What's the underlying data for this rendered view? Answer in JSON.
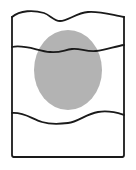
{
  "figure": {
    "title": "Schematic cross-section with wavy boundaries and central ellipse",
    "type": "line-art-diagram",
    "background_color": "#ffffff",
    "canvas": {
      "width": 136,
      "height": 170
    },
    "stroke": {
      "color": "#1a1a1a",
      "width": 1.8,
      "linejoin": "round",
      "linecap": "round"
    },
    "elements": {
      "outer_frame": {
        "name": "outer-frame",
        "description": "Rectangular frame, left/right/bottom straight, top edge wavy",
        "left_x": 12,
        "right_x": 124,
        "top_y": 17,
        "bottom_y": 157,
        "fill": "none"
      },
      "ellipse": {
        "name": "central-ellipse",
        "description": "Gray filled ellipse centered in the frame",
        "center_x": 68,
        "center_y": 70,
        "radius_x": 34,
        "radius_y": 40,
        "fill_color": "#b3b3b3",
        "stroke": "none"
      },
      "wavy_top_edge": {
        "name": "wavy-top-edge",
        "description": "Undulating top boundary of the frame",
        "path": "M 12 17 C 20 10, 34 10, 44 13 C 50 15, 54 21, 60 21 C 68 21, 76 13, 88 12 C 100 11, 112 15, 124 17"
      },
      "wavy_line_upper": {
        "name": "wavy-line-upper",
        "description": "Interior undulating horizontal line crossing the ellipse near its top",
        "path": "M 12 47 C 24 44, 38 51, 50 52 C 60 53, 64 50, 72 49 C 80 48, 86 52, 96 51 C 106 50, 116 46, 124 45"
      },
      "wavy_line_lower": {
        "name": "wavy-line-lower",
        "description": "Interior undulating horizontal line below the ellipse, dipping at center",
        "path": "M 12 113 C 24 112, 32 119, 42 122 C 52 125, 60 124, 68 123 C 78 122, 86 114, 98 112 C 110 110, 118 113, 124 115"
      }
    }
  },
  "chart_data": {
    "type": "diagram",
    "title": "Schematic cross-section with wavy boundaries and central ellipse",
    "shapes": [
      {
        "id": "outer-frame",
        "kind": "rectangle-wavy-top",
        "x": 12,
        "y": 17,
        "width": 112,
        "height": 140,
        "fill": "none",
        "stroke": "#1a1a1a"
      },
      {
        "id": "central-ellipse",
        "kind": "ellipse",
        "cx": 68,
        "cy": 70,
        "rx": 34,
        "ry": 40,
        "fill": "#b3b3b3",
        "stroke": "none"
      },
      {
        "id": "wavy-line-upper",
        "kind": "wavy-line",
        "y_mean": 48,
        "amplitude": 4,
        "x_start": 12,
        "x_end": 124,
        "stroke": "#1a1a1a"
      },
      {
        "id": "wavy-line-lower",
        "kind": "wavy-line",
        "y_mean": 117,
        "amplitude": 6,
        "x_start": 12,
        "x_end": 124,
        "stroke": "#1a1a1a"
      }
    ],
    "labels": [],
    "legend": [],
    "axes": null,
    "grid": false
  }
}
